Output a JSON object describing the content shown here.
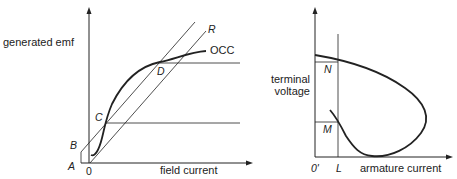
{
  "left_diagram": {
    "y_axis_label": "generated emf",
    "x_axis_label": "field current",
    "curve_label": "OCC",
    "line_label": "R",
    "points": {
      "A": "A",
      "B": "B",
      "C": "C",
      "D": "D",
      "origin": "0"
    }
  },
  "right_diagram": {
    "y_axis_label_line1": "terminal",
    "y_axis_label_line2": "voltage",
    "x_axis_label": "armature current",
    "points": {
      "N": "N",
      "M": "M",
      "L": "L",
      "origin": "0'"
    }
  },
  "colors": {
    "line": "#222222",
    "background": "#ffffff"
  }
}
